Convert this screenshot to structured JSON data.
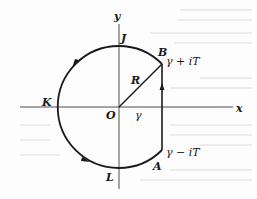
{
  "figure": {
    "type": "contour-diagram",
    "colors": {
      "ink": "#1a1a1a",
      "axis": "#3a3a3a",
      "background": "#fdfdfd",
      "bleed_through": "#e6e6e6"
    },
    "axes": {
      "x_label": "x",
      "y_label": "y",
      "origin_label": "O"
    },
    "points": {
      "J": "J",
      "B": "B",
      "K": "K",
      "L": "L",
      "A": "A"
    },
    "labels": {
      "radius": "R",
      "gamma": "γ",
      "upper_endpoint": "γ + iT",
      "lower_endpoint": "γ − iT"
    },
    "geometry": {
      "center": [
        119,
        107
      ],
      "radius_px": 61,
      "vertical_segment_x": 162,
      "B": [
        162,
        64
      ],
      "A": [
        162,
        150
      ]
    },
    "arrows": [
      {
        "name": "arrow-upper-left-arc",
        "direction": "counterclockwise"
      },
      {
        "name": "arrow-lower-left-arc",
        "direction": "counterclockwise"
      },
      {
        "name": "arrow-vertical-segment",
        "direction": "up"
      }
    ]
  }
}
